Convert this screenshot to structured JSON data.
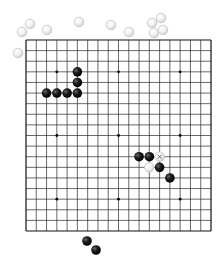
{
  "board": {
    "size": 19,
    "origin_x": 26,
    "origin_y": 40,
    "width": 185,
    "height": 191,
    "line_color": "#2a2a2a",
    "border_color": "#111111",
    "background": "#ffffff",
    "star_points": [
      [
        3,
        3
      ],
      [
        9,
        3
      ],
      [
        15,
        3
      ],
      [
        3,
        9
      ],
      [
        9,
        9
      ],
      [
        15,
        9
      ],
      [
        3,
        15
      ],
      [
        9,
        15
      ],
      [
        15,
        15
      ]
    ]
  },
  "colors": {
    "black_stone": "#111111",
    "black_highlight": "#6a6a6a",
    "white_stone": "#f4f4f4",
    "white_outline": "#c8c8c8",
    "marker": "#555555"
  },
  "stones_on_board": [
    {
      "color": "black",
      "col": 5,
      "row": 3
    },
    {
      "color": "black",
      "col": 5,
      "row": 4
    },
    {
      "color": "black",
      "col": 2,
      "row": 5
    },
    {
      "color": "black",
      "col": 3,
      "row": 5
    },
    {
      "color": "black",
      "col": 4,
      "row": 5
    },
    {
      "color": "black",
      "col": 5,
      "row": 5
    },
    {
      "color": "black",
      "col": 11,
      "row": 11
    },
    {
      "color": "black",
      "col": 12,
      "row": 11
    },
    {
      "color": "white",
      "col": 13,
      "row": 11,
      "marker": "x"
    },
    {
      "color": "white",
      "col": 12,
      "row": 12
    },
    {
      "color": "black",
      "col": 13,
      "row": 12
    },
    {
      "color": "black",
      "col": 14,
      "row": 13
    }
  ],
  "captured_white_stones": [
    {
      "x": 22,
      "y": 32
    },
    {
      "x": 30,
      "y": 24
    },
    {
      "x": 47,
      "y": 30
    },
    {
      "x": 18,
      "y": 53
    },
    {
      "x": 79,
      "y": 22
    },
    {
      "x": 111,
      "y": 25
    },
    {
      "x": 129,
      "y": 32
    },
    {
      "x": 152,
      "y": 23
    },
    {
      "x": 161,
      "y": 18
    },
    {
      "x": 154,
      "y": 33
    },
    {
      "x": 163,
      "y": 30
    }
  ],
  "captured_black_stones": [
    {
      "x": 87,
      "y": 241
    },
    {
      "x": 96,
      "y": 250
    }
  ],
  "last_move_marker": "x"
}
